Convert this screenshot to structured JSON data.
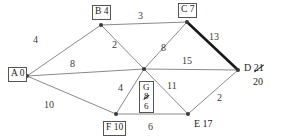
{
  "diagram": {
    "stroke_color": "#8a8a8a",
    "highlight_color": "#1a1a1a",
    "vertex_color": "#3a3a3a"
  },
  "nodes": [
    {
      "id": "A",
      "label": "A 0",
      "letter": "A",
      "value": "0",
      "boxed": true,
      "x": 22,
      "y": 73
    },
    {
      "id": "B",
      "label": "B 4",
      "letter": "B",
      "value": "4",
      "boxed": true,
      "x": 100,
      "y": 22
    },
    {
      "id": "C",
      "label": "C 7",
      "letter": "C",
      "value": "7",
      "boxed": true,
      "x": 186,
      "y": 20
    },
    {
      "id": "D",
      "label": "D 21",
      "letter": "D",
      "value": "21",
      "revised": "20",
      "boxed": false,
      "x": 243,
      "y": 67
    },
    {
      "id": "E",
      "label": "E 17",
      "letter": "E",
      "value": "17",
      "boxed": false,
      "x": 188,
      "y": 118
    },
    {
      "id": "F",
      "label": "F 10",
      "letter": "F",
      "value": "10",
      "boxed": true,
      "x": 116,
      "y": 118
    },
    {
      "id": "G",
      "label": "G 8 6",
      "letter": "G",
      "value": "8",
      "revised": "6",
      "boxed": true,
      "x": 146,
      "y": 70
    }
  ],
  "edges": [
    {
      "from": "A",
      "to": "B",
      "weight": "4",
      "highlighted": false,
      "label_x": 53,
      "label_y": 40
    },
    {
      "from": "A",
      "to": "G",
      "weight": "8",
      "highlighted": false,
      "label_x": 97,
      "label_y": 58
    },
    {
      "from": "A",
      "to": "F",
      "weight": "10",
      "highlighted": false,
      "label_x": 65,
      "label_y": 104
    },
    {
      "from": "B",
      "to": "C",
      "weight": "3",
      "highlighted": false,
      "label_x": 141,
      "label_y": 11
    },
    {
      "from": "B",
      "to": "G",
      "weight": "2",
      "highlighted": false,
      "label_x": 128,
      "label_y": 42
    },
    {
      "from": "C",
      "to": "G",
      "weight": "8",
      "highlighted": false,
      "label_x": 171,
      "label_y": 48
    },
    {
      "from": "C",
      "to": "D",
      "weight": "13",
      "highlighted": true,
      "label_x": 214,
      "label_y": 35
    },
    {
      "from": "G",
      "to": "D",
      "weight": "15",
      "highlighted": false,
      "label_x": 192,
      "label_y": 60
    },
    {
      "from": "G",
      "to": "E",
      "weight": "11",
      "highlighted": false,
      "label_x": 175,
      "label_y": 86
    },
    {
      "from": "G",
      "to": "F",
      "weight": "4",
      "highlighted": false,
      "label_x": 124,
      "label_y": 88
    },
    {
      "from": "F",
      "to": "E",
      "weight": "6",
      "highlighted": false,
      "label_x": 152,
      "label_y": 124
    },
    {
      "from": "E",
      "to": "D",
      "weight": "2",
      "highlighted": false,
      "label_x": 222,
      "label_y": 97
    }
  ]
}
